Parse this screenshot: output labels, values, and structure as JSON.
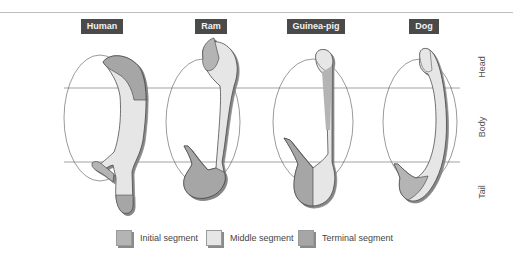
{
  "diagram": {
    "species": [
      {
        "label": "Human",
        "x": 81,
        "w": 42
      },
      {
        "label": "Ram",
        "x": 195,
        "w": 32
      },
      {
        "label": "Guinea-pig",
        "x": 287,
        "w": 58
      },
      {
        "label": "Dog",
        "x": 409,
        "w": 30
      }
    ],
    "regions": [
      {
        "label": "Head",
        "y": 68
      },
      {
        "label": "Body",
        "y": 128
      },
      {
        "label": "Tail",
        "y": 193
      }
    ],
    "legend": [
      {
        "label": "Initial segment",
        "color": "#b4b4b4"
      },
      {
        "label": "Middle segment",
        "color": "#e6e6e6"
      },
      {
        "label": "Terminal segment",
        "color": "#a6a6a6"
      }
    ],
    "colors": {
      "initial": "#b4b4b4",
      "middle": "#e6e6e6",
      "terminal": "#a6a6a6",
      "outline": "#3a3a3a",
      "label_bg": "#4a4a4a"
    }
  }
}
